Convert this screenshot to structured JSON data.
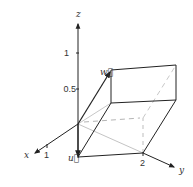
{
  "diagram": {
    "type": "3d-vectors-parallelepiped",
    "axes": {
      "x": {
        "label": "x",
        "ticks": [
          "1"
        ]
      },
      "y": {
        "label": "y",
        "ticks": [
          "2"
        ]
      },
      "z": {
        "label": "z",
        "ticks": [
          "1",
          "0.5"
        ]
      }
    },
    "vectors": [
      {
        "name": "u",
        "label": "u⃗"
      },
      {
        "name": "w",
        "label": "w⃗"
      }
    ],
    "colors": {
      "stroke": "#222222",
      "light": "#bdbdbd",
      "dashed": "#b0b0b0"
    }
  }
}
